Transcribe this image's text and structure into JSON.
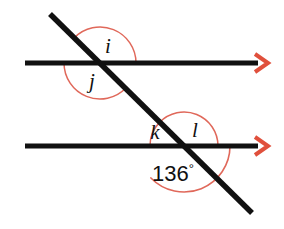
{
  "figure": {
    "background_color": "#ffffff",
    "line_color": "#111111",
    "arc_color": "#e0685a",
    "arrow_color": "#e0503c",
    "label_color": "#111111"
  },
  "lines": {
    "top_parallel": {
      "name": "top-parallel-line",
      "x1": 25,
      "y1": 63,
      "x2": 258,
      "y2": 63,
      "arrow": "right-arrowhead"
    },
    "bottom_parallel": {
      "name": "bottom-parallel-line",
      "x1": 25,
      "y1": 146,
      "x2": 258,
      "y2": 146,
      "arrow": "right-arrowhead"
    },
    "transversal": {
      "name": "transversal-line",
      "x1": 50,
      "y1": 14,
      "x2": 252,
      "y2": 213
    }
  },
  "intersections": {
    "upper": {
      "x": 100,
      "y": 63
    },
    "lower": {
      "x": 184,
      "y": 146
    }
  },
  "angles": [
    {
      "id": "i",
      "label": "i",
      "vertex": "upper",
      "label_x": 108,
      "label_y": 53,
      "arc_radius": 36,
      "start_deg": 224,
      "end_deg": 360,
      "description": "angle above transversal and right of it at upper intersection"
    },
    {
      "id": "j",
      "label": "j",
      "vertex": "upper",
      "label_x": 92,
      "label_y": 88,
      "arc_radius": 36,
      "start_deg": 44,
      "end_deg": 180,
      "description": "angle below transversal and left of it at upper intersection"
    },
    {
      "id": "k",
      "label": "k",
      "vertex": "lower",
      "label_x": 155,
      "label_y": 139,
      "arc_radius": 34,
      "start_deg": 180,
      "end_deg": 224,
      "description": "angle above bottom line and left of transversal at lower intersection"
    },
    {
      "id": "l",
      "label": "l",
      "vertex": "lower",
      "label_x": 195,
      "label_y": 137,
      "arc_radius": 34,
      "start_deg": 224,
      "end_deg": 360,
      "description": "angle above bottom line and right of transversal at lower intersection"
    }
  ],
  "measured_angle": {
    "id": "136",
    "value": "136",
    "degree_symbol": "°",
    "full_text": "136°",
    "vertex": "lower",
    "label_x": 152,
    "label_y": 181,
    "arc_radius": 46,
    "start_deg": 0,
    "end_deg": 136,
    "description": "reflex-side marked angle below bottom line, left of transversal"
  },
  "arrowheads": [
    {
      "name": "top-line-arrowhead",
      "tip_x": 268,
      "tip_y": 63
    },
    {
      "name": "bottom-line-arrowhead",
      "tip_x": 268,
      "tip_y": 146
    }
  ]
}
